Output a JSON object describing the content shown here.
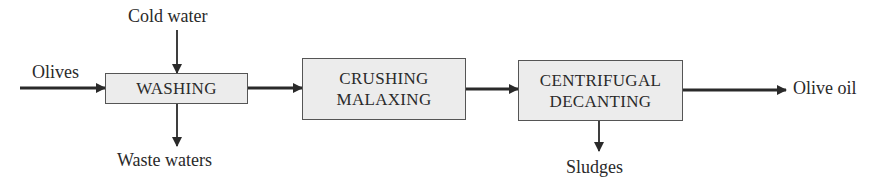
{
  "diagram": {
    "type": "process-flow",
    "processes": [
      {
        "id": "washing",
        "lines": [
          "WASHING"
        ]
      },
      {
        "id": "crushing",
        "lines": [
          "CRUSHING",
          "MALAXING"
        ]
      },
      {
        "id": "decanting",
        "lines": [
          "CENTRIFUGAL",
          "DECANTING"
        ]
      }
    ],
    "labels": {
      "input": "Olives",
      "cold_water": "Cold water",
      "waste_waters": "Waste waters",
      "sludges": "Sludges",
      "output": "Olive oil"
    },
    "colors": {
      "box_fill": "#ececec",
      "box_border": "#555555",
      "arrow": "#2a2a2a"
    }
  }
}
